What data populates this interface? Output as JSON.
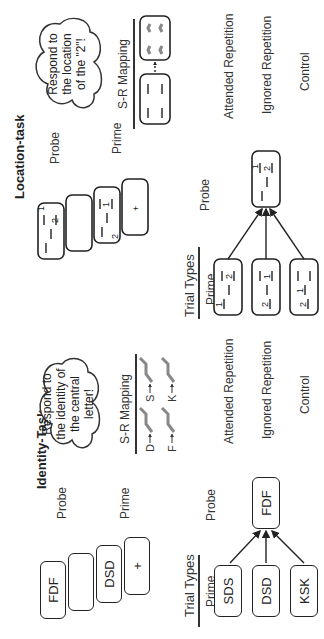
{
  "figure": {
    "panels": [
      {
        "id": "identity",
        "title": "Identity-Task",
        "sequence": {
          "label_probe": "Probe",
          "label_prime": "Prime",
          "frames": [
            "FDF",
            "",
            "DSD",
            "+"
          ]
        },
        "instruction": "Respond to the identity of the central letter!",
        "instruction_lines": [
          "Respond to",
          "the identity of",
          "the central",
          "letter!"
        ],
        "sr_mapping": {
          "title": "S-R Mapping",
          "pairs": [
            {
              "stimulus": "D",
              "response_key": "D"
            },
            {
              "stimulus": "S",
              "response_key": "S"
            },
            {
              "stimulus": "F",
              "response_key": "F"
            },
            {
              "stimulus": "K",
              "response_key": "K"
            }
          ]
        },
        "trial_types": {
          "title": "Trial Types",
          "prime_label": "Prime",
          "probe_label": "Probe",
          "probe": "FDF",
          "rows": [
            {
              "prime": "SDS",
              "type": "Attended Repetition"
            },
            {
              "prime": "DSD",
              "type": "Ignored Repetition"
            },
            {
              "prime": "KSK",
              "type": "Control"
            }
          ]
        }
      },
      {
        "id": "location",
        "title": "Location-task",
        "sequence": {
          "label_probe": "Probe",
          "label_prime": "Prime",
          "frames": [
            "probe: 1 at top-right slot, 2 at mid-right slot",
            "",
            "prime: 2 at bottom-left slot, 1 at mid-right slot",
            "+"
          ]
        },
        "instruction": "Respond to the location of the \"2\"!",
        "instruction_lines": [
          "Respond to",
          "the location",
          "of the \"2\"!"
        ],
        "sr_mapping": {
          "title": "S-R Mapping",
          "description": "four location placeholders mapped to four finger keys (dashed arrow)"
        },
        "trial_types": {
          "title": "Trial Types",
          "prime_label": "Prime",
          "probe_label": "Probe",
          "probe": "1 top-right, 2 mid-right",
          "rows": [
            {
              "prime": "1 top-left, 2 mid-right",
              "type": "Attended Repetition"
            },
            {
              "prime": "2 bottom-left, 1 mid-right",
              "type": "Ignored Repetition"
            },
            {
              "prime": "2 bottom-left, 1 mid-left",
              "type": "Control"
            }
          ]
        }
      }
    ],
    "labels": {
      "identity_title": "Identity-Task",
      "location_title": "Location-task",
      "probe": "Probe",
      "prime": "Prime",
      "sr_mapping": "S-R Mapping",
      "trial_types": "Trial Types",
      "attended": "Attended Repetition",
      "ignored": "Ignored Repetition",
      "control": "Control",
      "id_cloud": [
        "Respond to",
        "the identity of",
        "the central",
        "letter!"
      ],
      "loc_cloud": [
        "Respond to",
        "the location",
        "of the \"2\"!"
      ],
      "id_seq": [
        "FDF",
        "",
        "DSD",
        "+"
      ],
      "id_primes": [
        "SDS",
        "DSD",
        "KSK"
      ],
      "id_probe": "FDF",
      "sr_letters": [
        "D",
        "S",
        "F",
        "K"
      ],
      "digit_1": "1",
      "digit_2": "2"
    }
  }
}
